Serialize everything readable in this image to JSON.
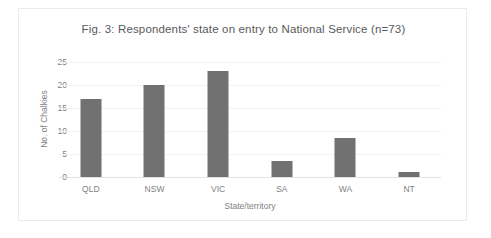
{
  "figure": {
    "title": "Fig. 3: Respondents' state on entry to National Service (n=73)"
  },
  "axes": {
    "y_title": "No. of Chalkies",
    "x_title": "State/territory",
    "y_ticks": [
      "0",
      "5",
      "10",
      "15",
      "20",
      "25"
    ]
  },
  "colors": {
    "bar": "#717171",
    "grid": "#f2f2f2",
    "text": "#7f7f7f",
    "title": "#595959",
    "frame": "#eceaea"
  },
  "chart_data": {
    "type": "bar",
    "title": "Fig. 3: Respondents' state on entry to National Service (n=73)",
    "xlabel": "State/territory",
    "ylabel": "No. of Chalkies",
    "categories": [
      "QLD",
      "NSW",
      "VIC",
      "SA",
      "WA",
      "NT"
    ],
    "values": [
      17,
      20,
      23,
      3.5,
      8.5,
      1
    ],
    "ylim": [
      0,
      25
    ],
    "ytick_step": 5,
    "grid": true,
    "legend": false,
    "total": 73
  }
}
